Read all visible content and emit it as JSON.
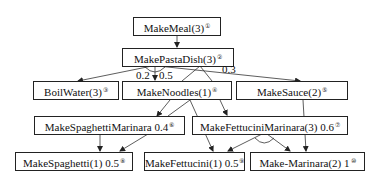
{
  "diagram": {
    "type": "htn-task-decomposition",
    "nodes": [
      {
        "id": "makemeal",
        "label": "MakeMeal(3)",
        "marker": "①"
      },
      {
        "id": "makepastadish",
        "label": "MakePastaDish(3)",
        "marker": "②"
      },
      {
        "id": "boilwater",
        "label": "BoilWater(3)",
        "marker": "③"
      },
      {
        "id": "makenoodles",
        "label": "MakeNoodles(1)",
        "marker": "④"
      },
      {
        "id": "makesauce",
        "label": "MakeSauce(2)",
        "marker": "⑤"
      },
      {
        "id": "makespaghettimarinara",
        "label": "MakeSpaghettiMarinara 0.4",
        "marker": "⑥"
      },
      {
        "id": "makefettucinimarinara",
        "label": "MakeFettuciniMarinara(3) 0.6",
        "marker": "⑦"
      },
      {
        "id": "makespaghetti",
        "label": "MakeSpaghetti(1) 0.5",
        "marker": "⑧"
      },
      {
        "id": "makefettucini",
        "label": "MakeFettucini(1) 0.5",
        "marker": "⑨"
      },
      {
        "id": "makemarinara",
        "label": "Make-Marinara(2) 1",
        "marker": "⑩"
      }
    ],
    "edge_labels": {
      "boilwater": "0.2",
      "makenoodles": "0.5",
      "makesauce": "0.3"
    },
    "edges": [
      {
        "from": "makemeal",
        "to": "makepastadish"
      },
      {
        "from": "makepastadish",
        "to": "boilwater",
        "weight": "0.2"
      },
      {
        "from": "makepastadish",
        "to": "makenoodles",
        "weight": "0.5"
      },
      {
        "from": "makepastadish",
        "to": "makesauce",
        "weight": "0.3"
      },
      {
        "from": "makepastadish",
        "to": "makespaghettimarinara"
      },
      {
        "from": "makepastadish",
        "to": "makefettucinimarinara"
      },
      {
        "from": "makenoodles",
        "to": "makespaghettimarinara"
      },
      {
        "from": "makenoodles",
        "to": "makefettucinimarinara"
      },
      {
        "from": "makenoodles",
        "to": "makefettucini"
      },
      {
        "from": "makenoodles",
        "to": "makespaghetti"
      },
      {
        "from": "makespaghettimarinara",
        "to": "makespaghetti"
      },
      {
        "from": "makespaghettimarinara",
        "to": "makespaghetti"
      },
      {
        "from": "makefettucinimarinara",
        "to": "makefettucini"
      },
      {
        "from": "makefettucinimarinara",
        "to": "makemarinara"
      },
      {
        "from": "makesauce",
        "to": "makemarinara"
      }
    ]
  }
}
